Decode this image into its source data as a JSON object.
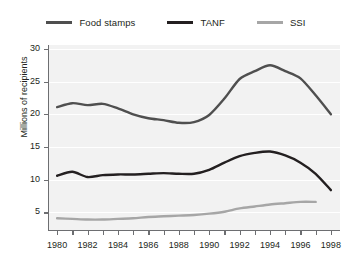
{
  "legend": {
    "position": "top-center",
    "entries": [
      {
        "label": "Food stamps",
        "color": "#4f4f4f",
        "name": "food-stamps"
      },
      {
        "label": "TANF",
        "color": "#231f20",
        "name": "tanf"
      },
      {
        "label": "SSI",
        "color": "#a6a6a6",
        "name": "ssi"
      }
    ]
  },
  "axes": {
    "ylabel": "Millions of recipients",
    "xlabel": "",
    "yticks": [
      5,
      10,
      15,
      20,
      25,
      30
    ],
    "ytick_labels": [
      "5",
      "10",
      "15",
      "20",
      "25",
      "30"
    ],
    "xtick_labels": [
      "1980",
      "1982",
      "1984",
      "1986",
      "1988",
      "1990",
      "1992",
      "1994",
      "1996",
      "1998"
    ],
    "xticks_minor": [
      1980,
      1981,
      1982,
      1983,
      1984,
      1985,
      1986,
      1987,
      1988,
      1989,
      1990,
      1991,
      1992,
      1993,
      1994,
      1995,
      1996,
      1997,
      1998
    ],
    "xlim": [
      1979.4,
      1998.6
    ],
    "ylim": [
      2.3,
      30.6
    ],
    "grid": "horizontal-white-on-gray"
  },
  "chart_data": {
    "type": "line",
    "title": "",
    "xlabel": "",
    "ylabel": "Millions of recipients",
    "xlim": [
      1979.4,
      1998.6
    ],
    "ylim": [
      2.3,
      30.6
    ],
    "grid": true,
    "legend_position": "top",
    "x": [
      1980,
      1981,
      1982,
      1983,
      1984,
      1985,
      1986,
      1987,
      1988,
      1989,
      1990,
      1991,
      1992,
      1993,
      1994,
      1995,
      1996,
      1997,
      1998
    ],
    "series": [
      {
        "name": "Food stamps",
        "color": "#4f4f4f",
        "values": [
          21.1,
          21.7,
          21.4,
          21.6,
          20.9,
          20.0,
          19.4,
          19.1,
          18.7,
          18.8,
          19.9,
          22.4,
          25.4,
          26.6,
          27.5,
          26.6,
          25.5,
          22.9,
          20.0
        ]
      },
      {
        "name": "TANF",
        "color": "#231f20",
        "values": [
          10.6,
          11.2,
          10.4,
          10.7,
          10.8,
          10.8,
          10.9,
          11.0,
          10.9,
          10.9,
          11.5,
          12.6,
          13.6,
          14.1,
          14.3,
          13.7,
          12.6,
          10.9,
          8.4
        ]
      },
      {
        "name": "SSI",
        "color": "#a6a6a6",
        "values": [
          4.1,
          4.0,
          3.9,
          3.9,
          4.0,
          4.1,
          4.3,
          4.4,
          4.5,
          4.6,
          4.8,
          5.1,
          5.6,
          5.9,
          6.2,
          6.4,
          6.6,
          6.6,
          null
        ]
      }
    ]
  }
}
